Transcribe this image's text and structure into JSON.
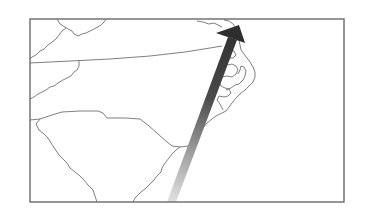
{
  "map": {
    "region": "Southeastern US Atlantic coast (South Carolina, North Carolina, Virginia)",
    "colors": {
      "background": "#ffffff",
      "frame": "#6a6a6a",
      "boundary": "#707070",
      "arrow_head": "#2e2e2e",
      "arrow_tail": "#dddddd"
    },
    "features": [
      {
        "name": "virginia-nc-border",
        "type": "state-boundary"
      },
      {
        "name": "south-carolina-outline",
        "type": "state-boundary"
      },
      {
        "name": "nc-outer-banks",
        "type": "coastline"
      },
      {
        "name": "storm-track-arrow",
        "type": "track",
        "direction": "north-northeast"
      }
    ]
  }
}
